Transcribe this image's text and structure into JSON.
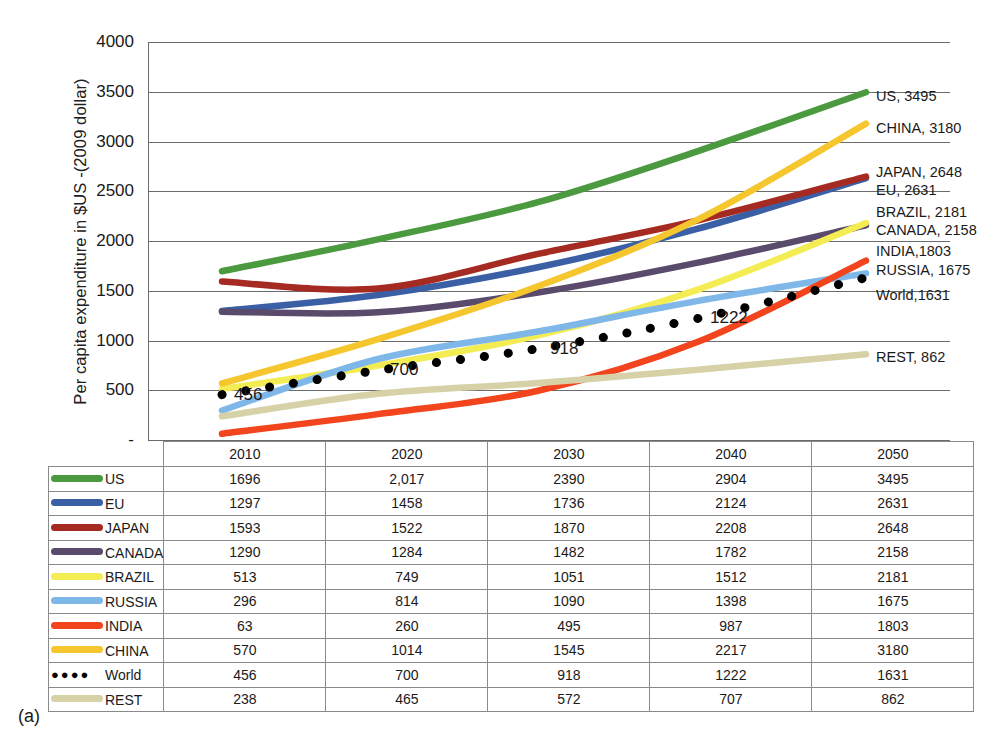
{
  "figure": {
    "caption": "(a)"
  },
  "chart_data": {
    "type": "line",
    "title": "",
    "xlabel": "",
    "ylabel": "Per capita expenditure in $US -(2009 dollar)",
    "categories": [
      "2010",
      "2020",
      "2030",
      "2040",
      "2050"
    ],
    "x": [
      2010,
      2020,
      2030,
      2040,
      2050
    ],
    "ylim": [
      0,
      4000
    ],
    "ytick_labels": [
      "-",
      "500",
      "1000",
      "1500",
      "2000",
      "2500",
      "3000",
      "3500",
      "4000"
    ],
    "ytick_values": [
      0,
      500,
      1000,
      1500,
      2000,
      2500,
      3000,
      3500,
      4000
    ],
    "grid": true,
    "legend_position": "right-inline",
    "series": [
      {
        "name": "US",
        "color": "#4c9a3f",
        "values": [
          1696,
          2017,
          2390,
          2904,
          3495
        ],
        "style": "solid"
      },
      {
        "name": "EU",
        "color": "#3a5fa5",
        "values": [
          1297,
          1458,
          1736,
          2124,
          2631
        ],
        "style": "solid"
      },
      {
        "name": "JAPAN",
        "color": "#a52a22",
        "values": [
          1593,
          1522,
          1870,
          2208,
          2648
        ],
        "style": "solid"
      },
      {
        "name": "CANADA",
        "color": "#5a4a6b",
        "values": [
          1290,
          1284,
          1482,
          1782,
          2158
        ],
        "style": "solid"
      },
      {
        "name": "BRAZIL",
        "color": "#f3ec52",
        "values": [
          513,
          749,
          1051,
          1512,
          2181
        ],
        "style": "solid"
      },
      {
        "name": "RUSSIA",
        "color": "#7fb7e8",
        "values": [
          296,
          814,
          1090,
          1398,
          1675
        ],
        "style": "solid"
      },
      {
        "name": "INDIA",
        "color": "#f2441d",
        "values": [
          63,
          260,
          495,
          987,
          1803
        ],
        "style": "solid"
      },
      {
        "name": "CHINA",
        "color": "#f5c62e",
        "values": [
          570,
          1014,
          1545,
          2217,
          3180
        ],
        "style": "solid"
      },
      {
        "name": "World",
        "color": "#000000",
        "values": [
          456,
          700,
          918,
          1222,
          1631
        ],
        "style": "dotted"
      },
      {
        "name": "REST",
        "color": "#d6d1a7",
        "values": [
          238,
          465,
          572,
          707,
          862
        ],
        "style": "solid"
      }
    ],
    "annotations": [
      {
        "text": "456",
        "series": "World",
        "x": 2010
      },
      {
        "text": "700",
        "series": "World",
        "x": 2020
      },
      {
        "text": "918",
        "series": "World",
        "x": 2030
      },
      {
        "text": "1222",
        "series": "World",
        "x": 2040
      }
    ],
    "end_labels": [
      {
        "text": "US, 3495",
        "series": "US"
      },
      {
        "text": "CHINA, 3180",
        "series": "CHINA"
      },
      {
        "text": "JAPAN, 2648",
        "series": "JAPAN"
      },
      {
        "text": "EU, 2631",
        "series": "EU"
      },
      {
        "text": "BRAZIL, 2181",
        "series": "BRAZIL"
      },
      {
        "text": "CANADA, 2158",
        "series": "CANADA"
      },
      {
        "text": "INDIA,1803",
        "series": "INDIA"
      },
      {
        "text": "RUSSIA, 1675",
        "series": "RUSSIA"
      },
      {
        "text": "World,1631",
        "series": "World"
      },
      {
        "text": "REST,  862",
        "series": "REST"
      }
    ]
  },
  "table": {
    "corner": "",
    "columns": [
      "2010",
      "2020",
      "2030",
      "2040",
      "2050"
    ],
    "rows": [
      {
        "label": "US",
        "color": "#4c9a3f",
        "marker": "line",
        "cells": [
          "1696",
          "2,017",
          "2390",
          "2904",
          "3495"
        ]
      },
      {
        "label": "EU",
        "color": "#3a5fa5",
        "marker": "line",
        "cells": [
          "1297",
          "1458",
          "1736",
          "2124",
          "2631"
        ]
      },
      {
        "label": "JAPAN",
        "color": "#a52a22",
        "marker": "line",
        "cells": [
          "1593",
          "1522",
          "1870",
          "2208",
          "2648"
        ]
      },
      {
        "label": "CANADA",
        "color": "#5a4a6b",
        "marker": "line",
        "cells": [
          "1290",
          "1284",
          "1482",
          "1782",
          "2158"
        ]
      },
      {
        "label": "BRAZIL",
        "color": "#f3ec52",
        "marker": "line",
        "cells": [
          "513",
          "749",
          "1051",
          "1512",
          "2181"
        ]
      },
      {
        "label": "RUSSIA",
        "color": "#7fb7e8",
        "marker": "line",
        "cells": [
          "296",
          "814",
          "1090",
          "1398",
          "1675"
        ]
      },
      {
        "label": "INDIA",
        "color": "#f2441d",
        "marker": "line",
        "cells": [
          "63",
          "260",
          "495",
          "987",
          "1803"
        ]
      },
      {
        "label": "CHINA",
        "color": "#f5c62e",
        "marker": "line",
        "cells": [
          "570",
          "1014",
          "1545",
          "2217",
          "3180"
        ]
      },
      {
        "label": "World",
        "color": "#000000",
        "marker": "dots",
        "cells": [
          "456",
          "700",
          "918",
          "1222",
          "1631"
        ]
      },
      {
        "label": "REST",
        "color": "#d6d1a7",
        "marker": "line",
        "cells": [
          "238",
          "465",
          "572",
          "707",
          "862"
        ]
      }
    ]
  }
}
